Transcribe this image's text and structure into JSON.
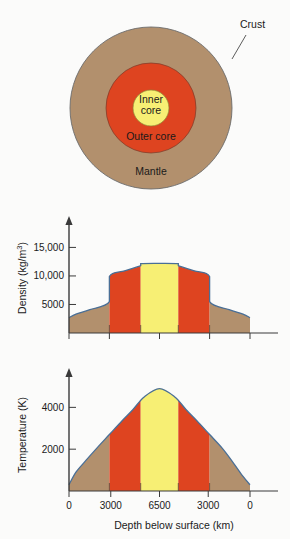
{
  "figure": {
    "background_color": "#fbfbfa"
  },
  "colors": {
    "mantle": "#b2906d",
    "outer_core": "#de4420",
    "inner_core": "#f7ef74",
    "curve_line": "#4a6f96",
    "axis": "#3a3a3a",
    "text": "#1a1a1a"
  },
  "cross_section": {
    "name": "earth-cross-section",
    "labels": {
      "crust": "Crust",
      "mantle": "Mantle",
      "outer_core": "Outer core",
      "inner_core_line1": "Inner",
      "inner_core_line2": "core"
    },
    "layers": [
      {
        "name": "mantle",
        "radius_px": 81,
        "color": "#b2906d"
      },
      {
        "name": "outer_core",
        "radius_px": 45,
        "color": "#de4420"
      },
      {
        "name": "inner_core",
        "radius_px": 18,
        "color": "#f7ef74"
      }
    ]
  },
  "chart_data": [
    {
      "type": "area",
      "name": "density-profile",
      "title": "",
      "xlabel": "",
      "ylabel": "Density (kg/m³)",
      "ylabel_parts": {
        "base": "Density (kg/m",
        "exponent": "3",
        "close": ")"
      },
      "yticks": [
        5000,
        10000,
        15000
      ],
      "ytick_labels": [
        "5000",
        "10,000",
        "15,000"
      ],
      "ylim": [
        0,
        17000
      ],
      "xlim": [
        0,
        13000
      ],
      "grid": false,
      "legend": "none",
      "x": [
        0,
        500,
        1500,
        2900,
        2900,
        4000,
        5150,
        5150,
        6500,
        7850,
        7850,
        9000,
        10100,
        10100,
        11500,
        12500,
        13000
      ],
      "values": [
        2700,
        3300,
        4100,
        5500,
        9900,
        10900,
        11800,
        12150,
        12200,
        12150,
        11800,
        10900,
        9900,
        5500,
        4100,
        3300,
        2700
      ],
      "regions": [
        {
          "label": "Mantle",
          "x_start": 0,
          "x_end": 2900,
          "color": "#b2906d"
        },
        {
          "label": "Outer core",
          "x_start": 2900,
          "x_end": 5150,
          "color": "#de4420"
        },
        {
          "label": "Inner core",
          "x_start": 5150,
          "x_end": 7850,
          "color": "#f7ef74"
        },
        {
          "label": "Outer core",
          "x_start": 7850,
          "x_end": 10100,
          "color": "#de4420"
        },
        {
          "label": "Mantle",
          "x_start": 10100,
          "x_end": 13000,
          "color": "#b2906d"
        }
      ]
    },
    {
      "type": "area",
      "name": "temperature-profile",
      "title": "",
      "xlabel": "Depth below surface (km)",
      "ylabel": "Temperature (K)",
      "yticks": [
        2000,
        4000
      ],
      "ytick_labels": [
        "2000",
        "4000"
      ],
      "ylim": [
        0,
        5500
      ],
      "xlim": [
        0,
        13000
      ],
      "xticks": [
        0,
        3000,
        6500,
        10000,
        13000
      ],
      "xtick_labels": [
        "0",
        "3000",
        "6500",
        "3000",
        "0"
      ],
      "grid": false,
      "legend": "none",
      "x": [
        0,
        500,
        1200,
        2000,
        2900,
        3800,
        4600,
        5400,
        6500,
        7600,
        8400,
        9200,
        10100,
        11000,
        11800,
        12500,
        13000
      ],
      "values": [
        300,
        900,
        1450,
        2050,
        2700,
        3350,
        3900,
        4500,
        4900,
        4500,
        3900,
        3350,
        2700,
        2050,
        1350,
        700,
        300
      ],
      "regions": [
        {
          "label": "Mantle",
          "x_start": 0,
          "x_end": 2900,
          "color": "#b2906d"
        },
        {
          "label": "Outer core",
          "x_start": 2900,
          "x_end": 5150,
          "color": "#de4420"
        },
        {
          "label": "Inner core",
          "x_start": 5150,
          "x_end": 7850,
          "color": "#f7ef74"
        },
        {
          "label": "Outer core",
          "x_start": 7850,
          "x_end": 10100,
          "color": "#de4420"
        },
        {
          "label": "Mantle",
          "x_start": 10100,
          "x_end": 13000,
          "color": "#b2906d"
        }
      ]
    }
  ]
}
